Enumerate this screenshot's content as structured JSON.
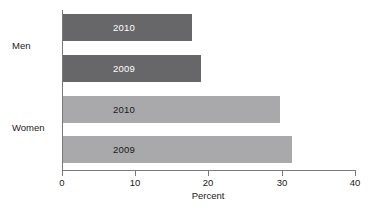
{
  "chart_data": {
    "type": "bar",
    "orientation": "horizontal",
    "title": "",
    "xlabel": "Percent",
    "ylabel": "",
    "xlim": [
      0,
      40
    ],
    "xticks": [
      0,
      10,
      20,
      30,
      40
    ],
    "xtick_labels": [
      "0",
      "10",
      "20",
      "30",
      "40"
    ],
    "grid": false,
    "legend": "none",
    "groups": [
      "Men",
      "Women"
    ],
    "categories": [
      "Men 2010",
      "Men 2009",
      "Women 2010",
      "Women 2009"
    ],
    "values": [
      17.6,
      18.8,
      29.6,
      31.3
    ],
    "bars": [
      {
        "group": "Men",
        "label": "2010",
        "value": 17.6,
        "color": "#67676a",
        "label_color": "#ffffff"
      },
      {
        "group": "Men",
        "label": "2009",
        "value": 18.8,
        "color": "#67676a",
        "label_color": "#ffffff"
      },
      {
        "group": "Women",
        "label": "2010",
        "value": 29.6,
        "color": "#a9a9ac",
        "label_color": "#1a1a1a"
      },
      {
        "group": "Women",
        "label": "2009",
        "value": 31.3,
        "color": "#a9a9ac",
        "label_color": "#1a1a1a"
      }
    ]
  },
  "axis": {
    "x_title": "Percent",
    "ticks": [
      {
        "label": "0"
      },
      {
        "label": "10"
      },
      {
        "label": "20"
      },
      {
        "label": "30"
      },
      {
        "label": "40"
      }
    ]
  },
  "groups": [
    {
      "label": "Men"
    },
    {
      "label": "Women"
    }
  ],
  "bars": [
    {
      "year": "2010"
    },
    {
      "year": "2009"
    },
    {
      "year": "2010"
    },
    {
      "year": "2009"
    }
  ],
  "colors": {
    "men_bar": "#67676a",
    "women_bar": "#a9a9ac",
    "axis": "#7a7a7a",
    "text": "#1a1a1a",
    "background": "#ffffff"
  }
}
